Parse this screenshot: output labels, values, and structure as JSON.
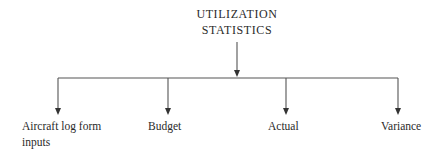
{
  "diagram": {
    "root": {
      "line1": "UTILIZATION",
      "line2": "STATISTICS"
    },
    "children": [
      {
        "line1": "Aircraft log form",
        "line2": "inputs"
      },
      {
        "line1": "Budget"
      },
      {
        "line1": "Actual"
      },
      {
        "line1": "Variance"
      }
    ],
    "colors": {
      "line": "#555555",
      "text": "#2a2a2a",
      "background": "#ffffff"
    }
  }
}
